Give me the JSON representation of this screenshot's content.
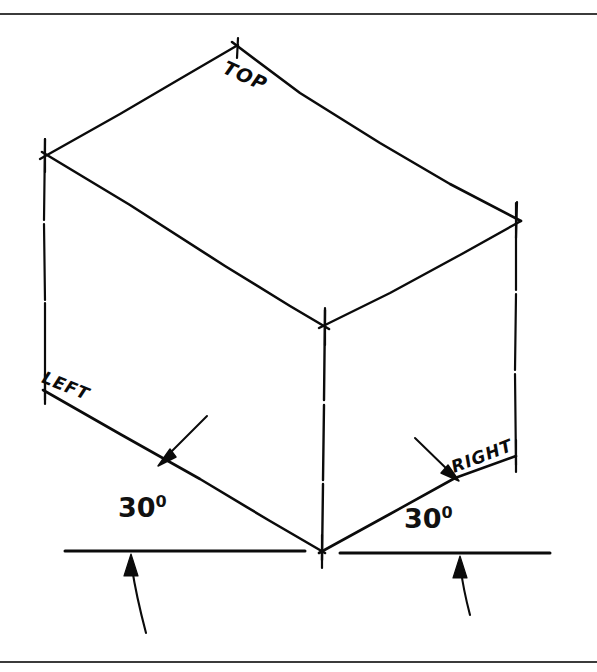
{
  "figure": {
    "kind": "isometric-cube-construction-diagram",
    "face_labels": {
      "top": "TOP",
      "left": "LEFT",
      "right": "RIGHT"
    },
    "angles": {
      "left_value": "30",
      "left_degree_symbol": "0",
      "right_value": "30",
      "right_degree_symbol": "0"
    },
    "colors": {
      "ink": "#0b0b0b",
      "rule": "#3b3b3b",
      "paper": "#ffffff"
    },
    "geometry": {
      "top_apex": [
        238,
        45
      ],
      "left_vertex": [
        45,
        155
      ],
      "right_vertex": [
        516,
        216
      ],
      "front_top_vertex": [
        325,
        325
      ],
      "bottom_vertex": [
        322,
        551
      ],
      "left_bottom_vertex": [
        45,
        393
      ],
      "right_bottom_vertex": [
        516,
        456
      ],
      "baseline_y": 551,
      "left_baseline_span": [
        65,
        305
      ],
      "right_baseline_span": [
        340,
        550
      ]
    }
  },
  "rules": {
    "top_rule": "horizontal-divider-top",
    "bottom_rule": "horizontal-divider-bottom"
  }
}
